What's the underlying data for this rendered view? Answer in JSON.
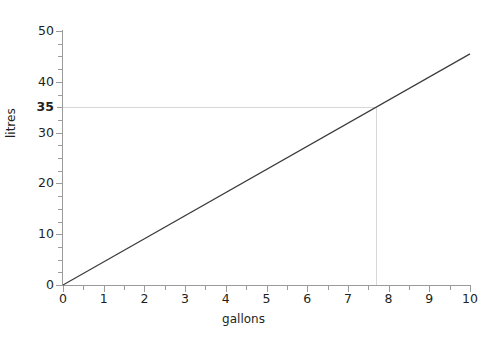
{
  "title": "Comments",
  "chart_data": {
    "type": "line",
    "title": "Comments",
    "xlabel": "gallons",
    "ylabel": "litres",
    "xlim": [
      0,
      10
    ],
    "ylim": [
      0,
      50
    ],
    "grid": false,
    "legend": null,
    "x_ticks": [
      0,
      1,
      2,
      3,
      4,
      5,
      6,
      7,
      8,
      9,
      10
    ],
    "x_tick_labels": [
      "0",
      "1",
      "2",
      "3",
      "4",
      "5",
      "6",
      "7",
      "8",
      "9",
      "10"
    ],
    "x_minor_ticks": [
      0.5,
      1.5,
      2.5,
      3.5,
      4.5,
      5.5,
      6.5,
      7.5,
      8.5,
      9.5
    ],
    "y_ticks": [
      0,
      10,
      20,
      30,
      40,
      50
    ],
    "y_tick_labels": [
      "0",
      "10",
      "20",
      "30",
      "40",
      "50"
    ],
    "y_special_ticks": [
      35
    ],
    "y_special_tick_labels": [
      "35"
    ],
    "y_minor_ticks": [
      2.5,
      5,
      7.5,
      12.5,
      15,
      17.5,
      22.5,
      25,
      27.5,
      32.5,
      37.5,
      42.5,
      45,
      47.5
    ],
    "series": [
      {
        "name": "gallons to litres",
        "x": [
          0,
          10
        ],
        "values": [
          0,
          45.5
        ],
        "color": "#3c3c3c"
      }
    ],
    "annotations": [
      {
        "type": "guide-horizontal",
        "value": 35,
        "label": "35",
        "color": "#d8d8d8",
        "from_x": 0,
        "to_x": 7.7
      },
      {
        "type": "guide-vertical",
        "value": 7.7,
        "color": "#d8d8d8",
        "from_y": 0,
        "to_y": 35
      }
    ]
  }
}
